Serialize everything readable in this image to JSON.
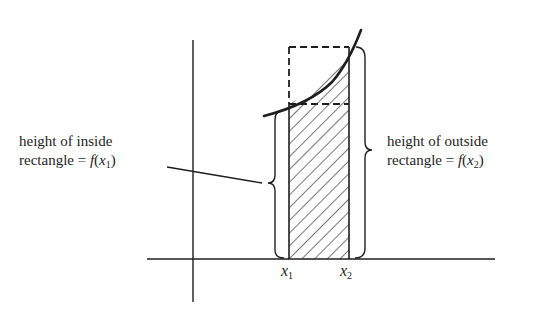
{
  "diagram": {
    "colors": {
      "ink": "#1e1e1e",
      "background": "#ffffff"
    },
    "left_label": {
      "line1": "height of inside",
      "line2_prefix": "rectangle = ",
      "func": "f",
      "arg": "x",
      "sub": "1"
    },
    "right_label": {
      "line1": "height of outside",
      "line2_prefix": "rectangle = ",
      "func": "f",
      "arg": "x",
      "sub": "2"
    },
    "x_ticks": [
      {
        "var": "x",
        "sub": "1"
      },
      {
        "var": "x",
        "sub": "2"
      }
    ]
  }
}
